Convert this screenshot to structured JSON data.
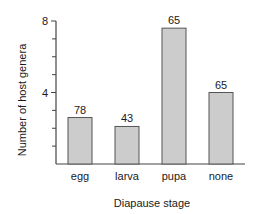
{
  "chart_data": {
    "type": "bar",
    "title": "",
    "xlabel": "Diapause stage",
    "ylabel": "Number of host genera",
    "categories": [
      "egg",
      "larva",
      "pupa",
      "none"
    ],
    "values": [
      2.6,
      2.1,
      7.6,
      4.0
    ],
    "bar_labels": [
      "78",
      "43",
      "65",
      "65"
    ],
    "ylim": [
      0,
      8
    ],
    "yticks_labeled": [
      4,
      8
    ],
    "yticks_minor": [
      1,
      2,
      3,
      5,
      6,
      7
    ],
    "grid": false,
    "legend": null,
    "bar_color": "#cccccc",
    "edge_color": "#555555"
  }
}
